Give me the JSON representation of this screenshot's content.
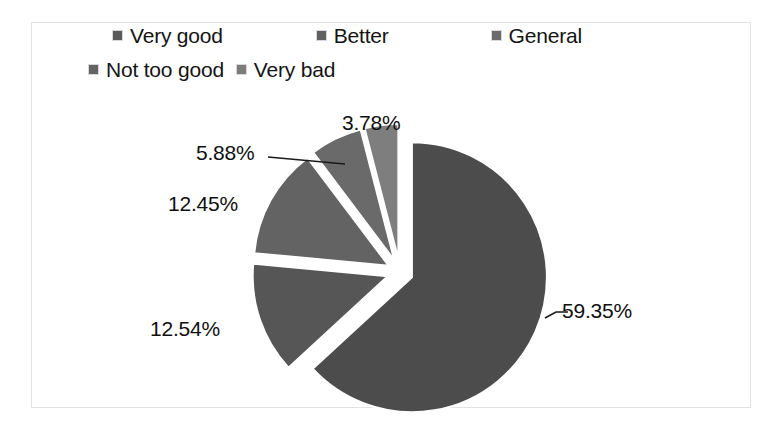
{
  "chart_data": {
    "type": "pie",
    "title": "",
    "subtitle": "",
    "xlabel": "",
    "ylabel": "",
    "grid": false,
    "legend_position": "top",
    "exploded": true,
    "start_angle_deg": 0,
    "direction": "clockwise",
    "units": "percent",
    "categories": [
      "Very good",
      "Better",
      "General",
      "Not too good",
      "Very bad"
    ],
    "values": [
      59.35,
      12.54,
      12.45,
      5.88,
      3.78
    ],
    "data_labels": [
      "59.35%",
      "12.54%",
      "12.45%",
      "5.88%",
      "3.78%"
    ],
    "colors": [
      "#4c4c4c",
      "#565656",
      "#636363",
      "#6a6a6a",
      "#7e7e7e"
    ],
    "slices": [
      {
        "label": "Very good",
        "value": 59.35,
        "display": "59.35%",
        "color": "#4c4c4c",
        "leader_line": true
      },
      {
        "label": "Better",
        "value": 12.54,
        "display": "12.54%",
        "color": "#565656",
        "leader_line": false
      },
      {
        "label": "General",
        "value": 12.45,
        "display": "12.45%",
        "color": "#636363",
        "leader_line": false
      },
      {
        "label": "Not too good",
        "value": 5.88,
        "display": "5.88%",
        "color": "#6a6a6a",
        "leader_line": true
      },
      {
        "label": "Very bad",
        "value": 3.78,
        "display": "3.78%",
        "color": "#7e7e7e",
        "leader_line": false
      }
    ]
  },
  "legend": {
    "rows": [
      [
        {
          "label": "Very good",
          "marker_color": "#5a5a5a",
          "icon": "legend-square-icon"
        },
        {
          "label": "Better",
          "marker_color": "#606060",
          "icon": "legend-square-icon"
        },
        {
          "label": "General",
          "marker_color": "#6b6b6b",
          "icon": "legend-square-icon"
        }
      ],
      [
        {
          "label": "Not too good",
          "marker_color": "#646464",
          "icon": "legend-square-icon"
        },
        {
          "label": "Very bad",
          "marker_color": "#7c7c7c",
          "icon": "legend-square-icon"
        }
      ]
    ]
  },
  "frame": {
    "border_color": "#e2e2e2",
    "background": "#ffffff"
  }
}
